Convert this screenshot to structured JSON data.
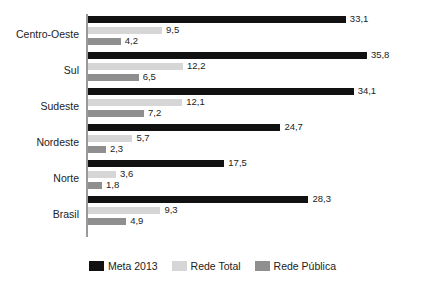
{
  "chart_data": {
    "type": "bar",
    "orientation": "horizontal",
    "title": "",
    "subtitle": "",
    "xlabel": "",
    "ylabel": "",
    "grid": false,
    "legend_position": "bottom-center",
    "xlim": [
      0,
      35.8
    ],
    "categories": [
      "Centro-Oeste",
      "Sul",
      "Sudeste",
      "Nordeste",
      "Norte",
      "Brasil"
    ],
    "series": [
      {
        "name": "Meta 2013",
        "color": "#111111",
        "values": [
          33.1,
          35.8,
          34.1,
          24.7,
          17.5,
          28.3
        ],
        "labels": [
          "33,1",
          "35,8",
          "34,1",
          "24,7",
          "17,5",
          "28,3"
        ]
      },
      {
        "name": "Rede Total",
        "color": "#d6d6d6",
        "values": [
          9.5,
          12.2,
          12.1,
          5.7,
          3.6,
          9.3
        ],
        "labels": [
          "9,5",
          "12,2",
          "12,1",
          "5,7",
          "3,6",
          "9,3"
        ]
      },
      {
        "name": "Rede Pública",
        "color": "#8f8f8f",
        "values": [
          4.2,
          6.5,
          7.2,
          2.3,
          1.8,
          4.9
        ],
        "labels": [
          "4,2",
          "6,5",
          "7,2",
          "2,3",
          "1,8",
          "4,9"
        ]
      }
    ]
  },
  "legend": {
    "items": [
      {
        "label": "Meta 2013",
        "color": "#111111"
      },
      {
        "label": "Rede Total",
        "color": "#d6d6d6"
      },
      {
        "label": "Rede Pública",
        "color": "#8f8f8f"
      }
    ]
  },
  "axis": {
    "category_labels": [
      "Centro-Oeste",
      "Sul",
      "Sudeste",
      "Nordeste",
      "Norte",
      "Brasil"
    ]
  }
}
